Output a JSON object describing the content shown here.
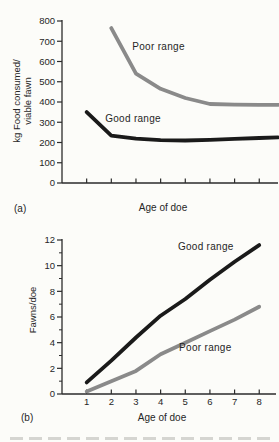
{
  "figure": {
    "background": "#fcfcf9",
    "panel_labels": {
      "a": "(a)",
      "b": "(b)"
    }
  },
  "colors": {
    "good_range_line": "#1a1a1a",
    "poor_range_line": "#8a8a8a",
    "axis": "#2b2b2b",
    "text": "#262626"
  },
  "chart_data": [
    {
      "id": "a",
      "type": "line",
      "panel_label": "(a)",
      "xlabel": "Age of doe",
      "ylabel_lines": [
        "kg Food consumed/",
        "viable fawn"
      ],
      "xlim": [
        0,
        8.76
      ],
      "ylim": [
        0,
        800
      ],
      "grid": false,
      "legend": "inline-labels",
      "x_ticks": [
        1,
        2,
        3,
        4,
        5,
        6,
        7,
        8
      ],
      "x_tick_labels": [
        "",
        "",
        "",
        "",
        "",
        "",
        "",
        ""
      ],
      "y_ticks": [
        0,
        100,
        200,
        300,
        400,
        500,
        600,
        700,
        800
      ],
      "y_tick_labels": [
        "0",
        "100",
        "200",
        "300",
        "400",
        "500",
        "600",
        "700",
        "800"
      ],
      "y_minor_ticks": [],
      "series": [
        {
          "name": "Poor range",
          "color_key": "poor_range_line",
          "x": [
            2,
            3,
            4,
            5,
            6,
            7,
            8,
            8.76
          ],
          "y": [
            765,
            540,
            465,
            420,
            390,
            387,
            386,
            386
          ],
          "label": {
            "text": "Poor range",
            "x": 2.85,
            "y": 655
          }
        },
        {
          "name": "Good range",
          "color_key": "good_range_line",
          "x": [
            1,
            2,
            3,
            4,
            5,
            6,
            7,
            8,
            8.76
          ],
          "y": [
            350,
            234,
            219,
            212,
            210,
            213,
            218,
            222,
            225
          ],
          "label": {
            "text": "Good range",
            "x": 1.75,
            "y": 300
          }
        }
      ]
    },
    {
      "id": "b",
      "type": "line",
      "panel_label": "(b)",
      "xlabel": "Age of doe",
      "ylabel_lines": [
        "Fawns/doe"
      ],
      "xlim": [
        0,
        8.68
      ],
      "ylim": [
        0,
        12
      ],
      "grid": false,
      "legend": "inline-labels",
      "x_ticks": [
        1,
        2,
        3,
        4,
        5,
        6,
        7,
        8
      ],
      "x_tick_labels": [
        "1",
        "2",
        "3",
        "4",
        "5",
        "6",
        "7",
        "8"
      ],
      "y_ticks": [
        0,
        2,
        4,
        6,
        8,
        10,
        12
      ],
      "y_tick_labels": [
        "0",
        "2",
        "4",
        "6",
        "8",
        "10",
        "12"
      ],
      "y_minor_ticks": [
        1,
        3,
        5,
        7,
        9,
        11
      ],
      "series": [
        {
          "name": "Good range",
          "color_key": "good_range_line",
          "x": [
            1,
            2,
            3,
            4,
            5,
            6,
            7,
            8
          ],
          "y": [
            0.9,
            2.6,
            4.4,
            6.1,
            7.4,
            8.9,
            10.3,
            11.6
          ],
          "label": {
            "text": "Good range",
            "x": 4.7,
            "y": 11.2
          }
        },
        {
          "name": "Poor range",
          "color_key": "poor_range_line",
          "x": [
            1,
            2,
            3,
            4,
            5,
            6,
            7,
            8
          ],
          "y": [
            0.2,
            1.0,
            1.8,
            3.1,
            4.0,
            4.9,
            5.8,
            6.8
          ],
          "label": {
            "text": "Poor range",
            "x": 4.75,
            "y": 3.35
          }
        }
      ]
    }
  ]
}
